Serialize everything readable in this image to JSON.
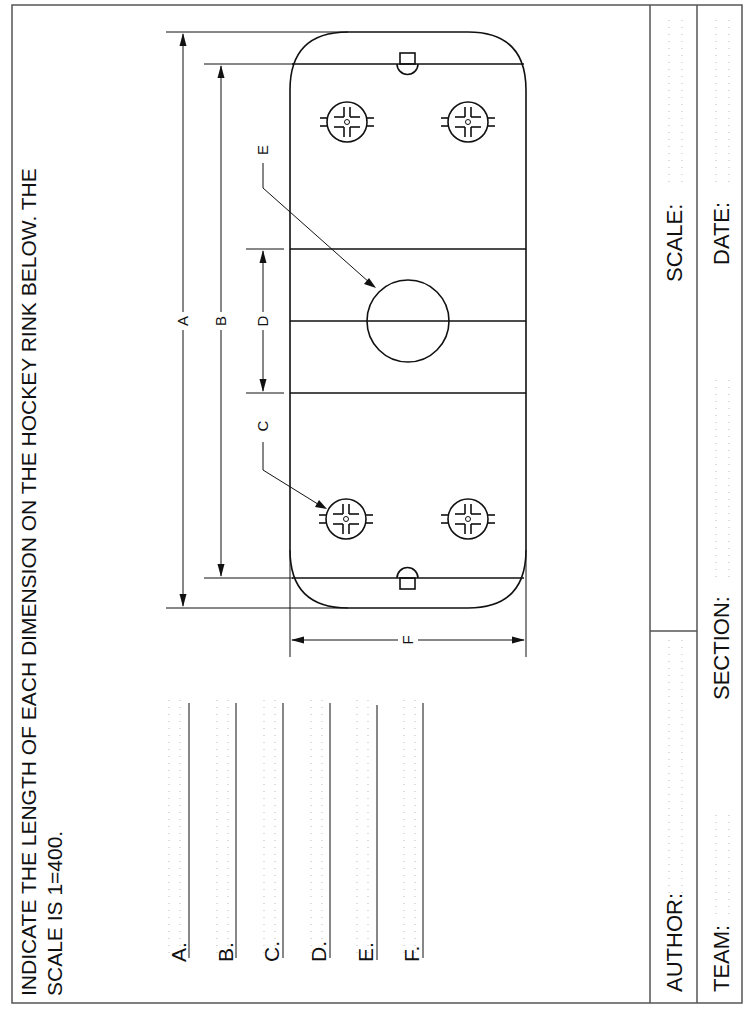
{
  "worksheet": {
    "instruction_line1": "INDICATE THE LENGTH OF EACH DIMENSION ON THE HOCKEY RINK BELOW.  THE",
    "instruction_line2": "SCALE IS 1=400."
  },
  "drawing": {
    "subject": "hockey rink",
    "dimension_labels": {
      "A": "A",
      "B": "B",
      "C": "C",
      "D": "D",
      "E": "E",
      "F": "F"
    },
    "icons": {
      "faceoff_circle": "faceoff-circle-icon",
      "center_circle": "center-circle-icon",
      "goal_crease": "goal-crease-icon"
    }
  },
  "answers": [
    {
      "label": "A.",
      "value": ""
    },
    {
      "label": "B.",
      "value": ""
    },
    {
      "label": "C.",
      "value": ""
    },
    {
      "label": "D.",
      "value": ""
    },
    {
      "label": "E.",
      "value": ""
    },
    {
      "label": "F.",
      "value": ""
    }
  ],
  "title_block": {
    "author_label": "AUTHOR:",
    "author_value": "",
    "scale_label": "SCALE:",
    "scale_value": "",
    "team_label": "TEAM:",
    "team_value": "",
    "section_label": "SECTION:",
    "section_value": "",
    "date_label": "DATE:",
    "date_value": ""
  }
}
